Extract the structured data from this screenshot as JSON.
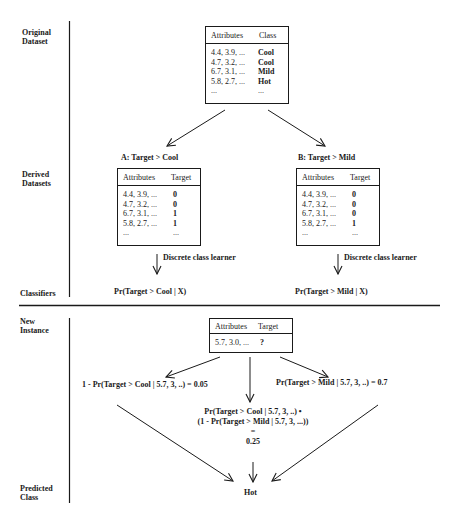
{
  "rows": {
    "original_dataset": [
      "Original",
      "Dataset"
    ],
    "derived_datasets": [
      "Derived",
      "Datasets"
    ],
    "classifiers": "Classifiers",
    "new_instance": [
      "New",
      "Instance"
    ],
    "predicted_class": [
      "Predicted",
      "Class"
    ]
  },
  "original_table": {
    "headers": [
      "Attributes",
      "Class"
    ],
    "rows": [
      [
        "4.4, 3.9, ...",
        "Cool"
      ],
      [
        "4.7, 3.2, ...",
        "Cool"
      ],
      [
        "6.7, 3.1, ...",
        "Mild"
      ],
      [
        "5.8, 2.7, ...",
        "Hot"
      ],
      [
        "...",
        "..."
      ]
    ]
  },
  "derived_a": {
    "title": "A:  Target > Cool",
    "headers": [
      "Attributes",
      "Target"
    ],
    "rows": [
      [
        "4.4, 3.9, ...",
        "0"
      ],
      [
        "4.7, 3.2, ...",
        "0"
      ],
      [
        "6.7, 3.1, ...",
        "1"
      ],
      [
        "5.8, 2.7, ...",
        "1"
      ],
      [
        "...",
        "..."
      ]
    ],
    "learner_label": "Discrete class learner",
    "classifier": "Pr(Target > Cool | X)"
  },
  "derived_b": {
    "title": "B:  Target > Mild",
    "headers": [
      "Attributes",
      "Target"
    ],
    "rows": [
      [
        "4.4, 3.9, ...",
        "0"
      ],
      [
        "4.7, 3.2, ...",
        "0"
      ],
      [
        "6.7, 3.1, ...",
        "0"
      ],
      [
        "5.8, 2.7, ...",
        "1"
      ],
      [
        "...",
        "..."
      ]
    ],
    "learner_label": "Discrete class learner",
    "classifier": "Pr(Target > Mild | X)"
  },
  "new_instance_table": {
    "headers": [
      "Attributes",
      "Target"
    ],
    "rows": [
      [
        "5.7, 3.0, ...",
        "?"
      ]
    ]
  },
  "predictions": {
    "left": "1 - Pr(Target > Cool | 5.7, 3, ..) = 0.05",
    "right": "Pr(Target > Mild | 5.7, 3, ..) = 0.7",
    "middle_line1": "Pr(Target > Cool | 5.7, 3, ..) •",
    "middle_line2": "(1 - Pr(Target > Mild | 5.7, 3, ...))",
    "middle_eq": "=",
    "middle_value": "0.25"
  },
  "predicted_class": "Hot"
}
